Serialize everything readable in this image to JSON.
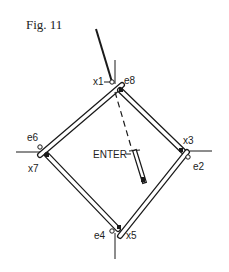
{
  "figure": {
    "title": "Fig. 11",
    "colors": {
      "ink": "#1a1a1a",
      "background": "#ffffff"
    }
  },
  "labels": {
    "x1": "x1",
    "e8": "e8",
    "e6": "e6",
    "x7": "x7",
    "x3": "x3",
    "e2": "e2",
    "e4": "e4",
    "x5": "x5",
    "enter": "ENTER"
  }
}
